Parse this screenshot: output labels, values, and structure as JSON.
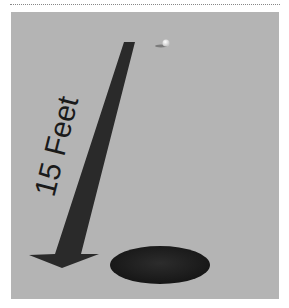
{
  "figure": {
    "label": "15 Feet",
    "colors": {
      "background": "#b4b4b4",
      "arrow": "#2a2a2a",
      "hole": "#1e1e1e",
      "ball": "#f2f2f2"
    }
  }
}
